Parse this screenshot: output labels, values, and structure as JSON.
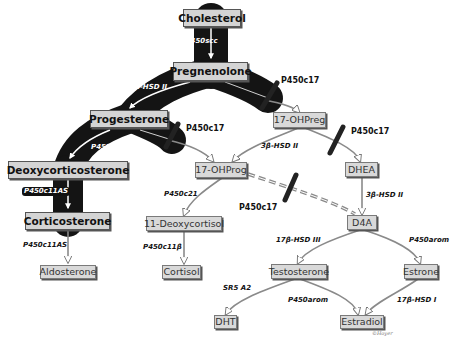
{
  "diagram": {
    "type": "steroidogenesis-pathway",
    "nodes": {
      "cholesterol": "Cholesterol",
      "pregnenolone": "Pregnenolone",
      "progesterone": "Progesterone",
      "deoxycorticosterone": "Deoxycorticosterone",
      "corticosterone": "Corticosterone",
      "aldosterone": "Aldosterone",
      "ohpreg17": "17-OHPreg",
      "ohprog17": "17-OHProg",
      "deoxycortisol11": "11-Deoxycortisol",
      "cortisol": "Cortisol",
      "dhea": "DHEA",
      "d4a": "D4A",
      "testosterone": "Testosterone",
      "estrone": "Estrone",
      "dht": "DHT",
      "estradiol": "Estradiol"
    },
    "enzymes": {
      "chol_to_preg": "StAR, P450scc",
      "preg_to_prog": "3β-HSD II",
      "prog_to_doc": "P450c21",
      "doc_to_cort": "P450c11AS",
      "cort_to_aldo": "P450c11AS",
      "ohpreg_to_ohprog": "3β-HSD II",
      "ohprog_to_deoxycortisol": "P450c21",
      "deoxycortisol_to_cortisol": "P450c11β",
      "dhea_to_d4a": "3β-HSD II",
      "d4a_to_testosterone": "17β-HSD III",
      "d4a_to_estrone": "P450arom",
      "testosterone_to_dht": "SR5 A2",
      "testosterone_to_estradiol": "P450arom",
      "estrone_to_estradiol": "17β-HSD I"
    },
    "blocked": {
      "preg_to_ohpreg": "P450c17",
      "prog_to_ohprog": "P450c17",
      "ohpreg_to_dhea": "P450c17",
      "ohprog_to_d4a": "P450c17"
    },
    "signature": "©Hoyer",
    "colors": {
      "active_path": "#141414",
      "node_fill": "#d6d6d6",
      "arrow": "#8a8a8a",
      "blocker": "#222222"
    }
  }
}
